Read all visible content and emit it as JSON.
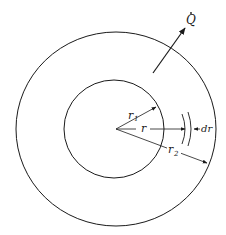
{
  "diagram": {
    "type": "concentric-cylinder-heat-conduction",
    "colors": {
      "stroke": "#1a1a1a",
      "background": "#ffffff"
    },
    "labels": {
      "heat_flow": "Q",
      "inner_radius": "r",
      "inner_radius_sub": "1",
      "radius": "r",
      "outer_radius": "r",
      "outer_radius_sub": "2",
      "shell_thickness": "dr"
    }
  }
}
